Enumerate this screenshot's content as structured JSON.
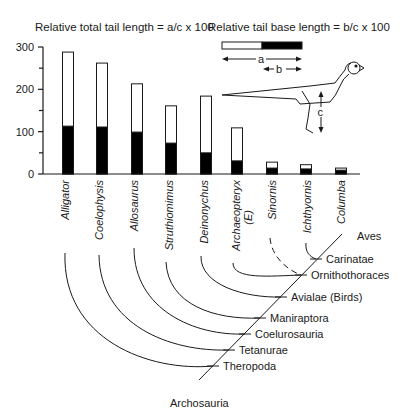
{
  "titles": {
    "left": "Relative total tail length = a/c x 100",
    "right": "Relative tail base length = b/c x 100"
  },
  "legend": {
    "label_a": "a",
    "label_b": "b",
    "label_c": "c"
  },
  "colors": {
    "ink": "#1a1a1a",
    "bar_fill_total": "#ffffff",
    "bar_fill_base": "#000000",
    "background": "#ffffff"
  },
  "chart_data": {
    "type": "bar",
    "xlabel": "",
    "ylabel": "",
    "ylim": [
      0,
      300
    ],
    "yticks": [
      0,
      100,
      200,
      300
    ],
    "categories": [
      "Alligator",
      "Coelophysis",
      "Allosaurus",
      "Struthiomimus",
      "Deinonychus",
      "Archaeopteryx (E)",
      "Sinornis",
      "Ichthyornis",
      "Columba"
    ],
    "series": [
      {
        "name": "Relative total tail length (a/c x 100)",
        "style": "open bar",
        "values": [
          288,
          262,
          213,
          161,
          184,
          109,
          28,
          22,
          14
        ]
      },
      {
        "name": "Relative tail base length (b/c x 100)",
        "style": "filled black bar",
        "values": [
          113,
          111,
          99,
          73,
          50,
          31,
          14,
          12,
          9
        ]
      }
    ],
    "grid": false,
    "legend_position": "none"
  },
  "axis": {
    "ticks": [
      {
        "value": 0,
        "label": "0"
      },
      {
        "value": 100,
        "label": "100"
      },
      {
        "value": 200,
        "label": "200"
      },
      {
        "value": 300,
        "label": "300"
      }
    ]
  },
  "taxa": [
    {
      "name": "Alligator"
    },
    {
      "name": "Coelophysis"
    },
    {
      "name": "Allosaurus"
    },
    {
      "name": "Struthiomimus"
    },
    {
      "name": "Deinonychus"
    },
    {
      "name": "Archaeopteryx",
      "sub": "(E)"
    },
    {
      "name": "Sinornis"
    },
    {
      "name": "Ichthyornis"
    },
    {
      "name": "Columba"
    }
  ],
  "clades": [
    {
      "name": "Aves"
    },
    {
      "name": "Carinatae"
    },
    {
      "name": "Ornithothoraces"
    },
    {
      "name": "Avialae (Birds)"
    },
    {
      "name": "Maniraptora"
    },
    {
      "name": "Coelurosauria"
    },
    {
      "name": "Tetanurae"
    },
    {
      "name": "Theropoda"
    },
    {
      "name": "Archosauria"
    }
  ]
}
